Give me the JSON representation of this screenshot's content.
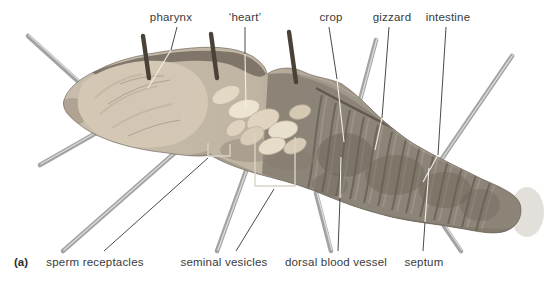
{
  "figure": {
    "panel_tag": "(a)",
    "annotations": {
      "top": [
        {
          "id": "pharynx",
          "label": "pharynx"
        },
        {
          "id": "heart",
          "label": "‘heart’"
        },
        {
          "id": "crop",
          "label": "crop"
        },
        {
          "id": "gizzard",
          "label": "gizzard"
        },
        {
          "id": "intestine",
          "label": "intestine"
        }
      ],
      "bottom": [
        {
          "id": "sperm-receptacles",
          "label": "sperm receptacles"
        },
        {
          "id": "seminal-vesicles",
          "label": "seminal vesicles"
        },
        {
          "id": "dorsal-blood-vessel",
          "label": "dorsal blood vessel"
        },
        {
          "id": "septum",
          "label": "septum"
        }
      ]
    },
    "colors": {
      "background": "#ffffff",
      "label_text": "#3a3a3a",
      "pin_metal": "#a3a3a3",
      "pin_highlight": "#dcdcdc",
      "pin_dark": "#4b4237",
      "leader_dark": "#4a4a4a",
      "leader_light": "#f2efe7",
      "bracket_light": "#d9d4c6",
      "body_anterior": "#cdc2b1",
      "body_posterior": "#8d8478",
      "organ_cream": "#e8dfce"
    }
  }
}
